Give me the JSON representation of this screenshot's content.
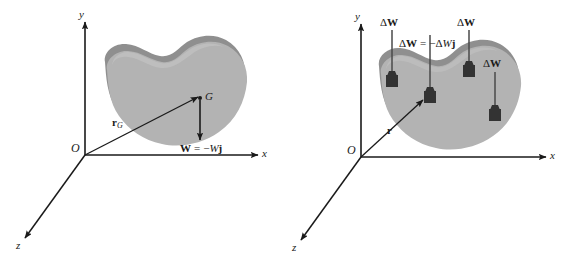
{
  "figure": {
    "background_color": "#ffffff",
    "ink_color": "#1a1a1a",
    "body_fill": "#b3b3b3",
    "rim_fill": "#8f8f8f",
    "block_fill": "#333333",
    "panel_count": 2
  },
  "panels": [
    {
      "id": "left",
      "caption": "Resultant weight acting at center of gravity G",
      "axes": {
        "y_label": "y",
        "x_label": "x",
        "z_label": "z",
        "origin_label": "O"
      },
      "points": [
        {
          "name": "center-of-gravity",
          "label": "G"
        }
      ],
      "vectors": [
        {
          "name": "position-vector",
          "label_parts": {
            "symbol": "r",
            "subscript": "G"
          }
        },
        {
          "name": "weight-vector",
          "label": "W = −Wj",
          "label_parts": {
            "vector": "W",
            "equals": "=",
            "minus": "−",
            "scalar": "W",
            "unit": "j"
          }
        }
      ]
    },
    {
      "id": "right",
      "caption": "Differential weight elements acting on the body",
      "axes": {
        "y_label": "y",
        "x_label": "x",
        "z_label": "z",
        "origin_label": "O"
      },
      "vectors": [
        {
          "name": "position-vector",
          "label_parts": {
            "symbol": "r"
          }
        }
      ],
      "weight_elements": [
        {
          "name": "weight-element-1",
          "label": "ΔW"
        },
        {
          "name": "weight-element-2",
          "label": "ΔW = −ΔWj",
          "is_definition": true
        },
        {
          "name": "weight-element-3",
          "label": "ΔW"
        },
        {
          "name": "weight-element-4",
          "label": "ΔW"
        }
      ],
      "label_parts": {
        "delta": "Δ",
        "vector": "W",
        "equals": "=",
        "minus": "−",
        "scalar": "W",
        "unit": "j"
      }
    }
  ]
}
